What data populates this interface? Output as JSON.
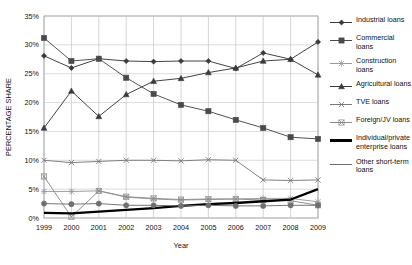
{
  "chart_data": {
    "type": "line",
    "title": "",
    "xlabel": "Year",
    "ylabel": "PERCENTAGE SHARE",
    "x": [
      1999,
      2000,
      2001,
      2002,
      2003,
      2004,
      2005,
      2006,
      2007,
      2008,
      2009
    ],
    "categories": [
      "1999",
      "2000",
      "2001",
      "2002",
      "2003",
      "2004",
      "2005",
      "2006",
      "2007",
      "2008",
      "2009"
    ],
    "xlim": [
      1999,
      2009
    ],
    "ylim": [
      0,
      35
    ],
    "ytick_labels": [
      "0%",
      "5%",
      "10%",
      "15%",
      "20%",
      "25%",
      "30%",
      "35%"
    ],
    "ytick_values": [
      0,
      5,
      10,
      15,
      20,
      25,
      30,
      35
    ],
    "grid": true,
    "legend_position": "right",
    "series": [
      {
        "name": "Industrial loans",
        "marker": "diamond",
        "color": "#3a3a3a",
        "values": [
          28.1,
          26.0,
          27.6,
          27.2,
          27.1,
          27.2,
          27.2,
          25.9,
          28.6,
          27.5,
          30.5
        ]
      },
      {
        "name": "Commercial loans",
        "marker": "square",
        "color": "#4a4a4a",
        "values": [
          31.2,
          27.2,
          27.6,
          24.3,
          21.5,
          19.6,
          18.5,
          17.0,
          15.6,
          14.0,
          13.7
        ]
      },
      {
        "name": "Construction loans",
        "marker": "asterisk",
        "color": "#9a9a9a",
        "values": [
          4.6,
          4.6,
          4.7,
          3.6,
          3.3,
          3.1,
          3.2,
          3.3,
          3.4,
          3.4,
          2.8
        ]
      },
      {
        "name": "Agricultural loans",
        "marker": "triangle",
        "color": "#3a3a3a",
        "values": [
          15.6,
          22.0,
          17.6,
          21.4,
          23.7,
          24.2,
          25.2,
          26.0,
          27.2,
          27.5,
          24.8
        ]
      },
      {
        "name": "TVE loans",
        "marker": "x",
        "color": "#7a7a7a",
        "values": [
          10.0,
          9.6,
          9.8,
          10.0,
          10.0,
          9.9,
          10.1,
          10.0,
          6.6,
          6.5,
          6.6
        ]
      },
      {
        "name": "Foreign/JV loans",
        "marker": "x-box",
        "color": "#8a8a8a",
        "values": [
          7.2,
          0.2,
          4.7,
          3.7,
          3.4,
          3.2,
          3.3,
          3.3,
          3.1,
          3.0,
          2.2
        ]
      },
      {
        "name": "Individual/private enterprise loans",
        "marker": "none",
        "color": "#000000",
        "thick": true,
        "values": [
          0.9,
          0.8,
          1.1,
          1.4,
          1.7,
          2.1,
          2.4,
          2.6,
          2.9,
          3.2,
          5.0
        ]
      },
      {
        "name": "Other short-term loans",
        "marker": "circle",
        "color": "#6f6f6f",
        "values": [
          2.5,
          2.4,
          2.5,
          2.2,
          2.2,
          2.1,
          2.2,
          2.1,
          2.1,
          2.2,
          2.2
        ]
      }
    ]
  },
  "axis": {
    "y_title": "PERCENTAGE SHARE",
    "x_title": "Year"
  },
  "legend": {
    "items": [
      {
        "label": "Industrial loans",
        "marker": "diamond",
        "color": "#3a3a3a"
      },
      {
        "label": "Commercial loans",
        "marker": "square",
        "color": "#4a4a4a"
      },
      {
        "label": "Construction loans",
        "marker": "asterisk",
        "color": "#9a9a9a"
      },
      {
        "label": "Agricultural loans",
        "marker": "triangle",
        "color": "#3a3a3a"
      },
      {
        "label": "TVE loans",
        "marker": "x",
        "color": "#7a7a7a"
      },
      {
        "label": "Foreign/JV loans",
        "marker": "x-box",
        "color": "#8a8a8a"
      },
      {
        "label": "Individual/private enterprise loans",
        "marker": "none",
        "color": "#000000"
      },
      {
        "label": "Other short-term loans",
        "marker": "none-thin",
        "color": "#6f6f6f"
      }
    ]
  }
}
